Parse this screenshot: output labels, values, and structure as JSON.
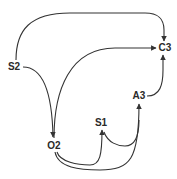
{
  "diagram": {
    "type": "directed-graph",
    "nodes": [
      {
        "id": "S2",
        "label": "S2",
        "x": 14,
        "y": 67
      },
      {
        "id": "C3",
        "label": "C3",
        "x": 165,
        "y": 48
      },
      {
        "id": "O2",
        "label": "O2",
        "x": 54,
        "y": 146
      },
      {
        "id": "S1",
        "label": "S1",
        "x": 101,
        "y": 123
      },
      {
        "id": "A3",
        "label": "A3",
        "x": 139,
        "y": 96
      }
    ],
    "edges": [
      {
        "from": "S2",
        "to": "C3"
      },
      {
        "from": "S2",
        "to": "O2"
      },
      {
        "from": "O2",
        "to": "C3"
      },
      {
        "from": "A3",
        "to": "C3"
      },
      {
        "from": "O2",
        "to": "S1"
      },
      {
        "from": "O2",
        "to": "A3"
      },
      {
        "from": "S1",
        "to": "A3"
      }
    ],
    "colors": {
      "line": "#333333",
      "text": "#2a2a2a",
      "background": "#ffffff"
    }
  }
}
